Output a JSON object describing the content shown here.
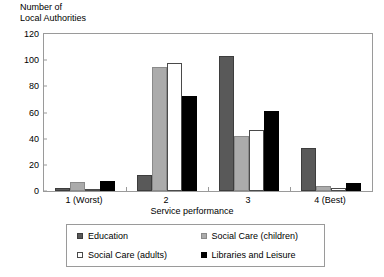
{
  "chart_data": {
    "type": "bar",
    "title": "",
    "ylabel": "Number of\nLocal Authorities",
    "xlabel": "Service performance",
    "categories": [
      "1 (Worst)",
      "2",
      "3",
      "4 (Best)"
    ],
    "ylim": [
      0,
      120
    ],
    "yticks": [
      0,
      20,
      40,
      60,
      80,
      100,
      120
    ],
    "grid": false,
    "legend_position": "bottom",
    "series": [
      {
        "name": "Education",
        "color": "#595959",
        "values": [
          2,
          12,
          103,
          33
        ]
      },
      {
        "name": "Social Care (children)",
        "color": "#ababab",
        "values": [
          7,
          95,
          42,
          4
        ]
      },
      {
        "name": "Social Care (adults)",
        "color": "#ffffff",
        "values": [
          1,
          98,
          47,
          2
        ]
      },
      {
        "name": "Libraries and Leisure",
        "color": "#000000",
        "values": [
          8,
          73,
          61,
          6
        ]
      }
    ]
  }
}
